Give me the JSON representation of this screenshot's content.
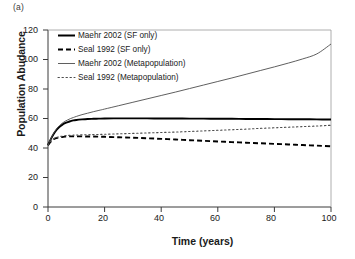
{
  "panel": {
    "label": "(a)"
  },
  "chart_data": {
    "type": "line",
    "title": "",
    "subtitle": "",
    "panel_label": "(a)",
    "xlabel": "Time (years)",
    "ylabel": "Population Abudance",
    "xlim": [
      0,
      100
    ],
    "ylim": [
      0,
      120
    ],
    "xticks": [
      0,
      20,
      40,
      60,
      80,
      100
    ],
    "yticks": [
      0,
      20,
      40,
      60,
      80,
      100,
      120
    ],
    "grid": false,
    "legend_position": "top-left-inside",
    "x": [
      0,
      1,
      2,
      3,
      4,
      5,
      6,
      7,
      8,
      9,
      10,
      12,
      14,
      16,
      18,
      20,
      25,
      30,
      35,
      40,
      45,
      50,
      55,
      60,
      65,
      70,
      75,
      80,
      85,
      90,
      95,
      100
    ],
    "series": [
      {
        "name": "Maehr 2002 (SF only)",
        "style": "solid-thick",
        "color": "#000000",
        "values": [
          42.0,
          46.0,
          49.5,
          52.2,
          54.2,
          55.7,
          56.8,
          57.6,
          58.2,
          58.7,
          59.0,
          59.4,
          59.7,
          59.8,
          59.9,
          60.0,
          60.1,
          60.1,
          60.1,
          60.0,
          60.0,
          59.9,
          59.9,
          59.8,
          59.8,
          59.7,
          59.7,
          59.6,
          59.5,
          59.5,
          59.4,
          59.3
        ]
      },
      {
        "name": "Seal 1992 (SF only)",
        "style": "dashed-thick",
        "color": "#000000",
        "values": [
          42.0,
          44.4,
          45.9,
          46.7,
          47.2,
          47.5,
          47.7,
          47.8,
          47.9,
          47.9,
          47.9,
          47.9,
          47.8,
          47.8,
          47.7,
          47.6,
          47.3,
          47.0,
          46.6,
          46.2,
          45.8,
          45.3,
          44.9,
          44.4,
          44.0,
          43.6,
          43.2,
          42.8,
          42.4,
          42.0,
          41.6,
          41.2
        ]
      },
      {
        "name": "Maehr 2002 (Metapopulation)",
        "style": "solid-thin",
        "color": "#4d4d4d",
        "values": [
          42.0,
          46.3,
          50.0,
          52.9,
          55.1,
          56.8,
          58.1,
          59.1,
          60.0,
          60.7,
          61.4,
          62.6,
          63.6,
          64.6,
          65.5,
          66.4,
          68.7,
          71.0,
          73.3,
          75.6,
          77.9,
          80.3,
          82.7,
          85.1,
          87.5,
          90.0,
          92.5,
          95.0,
          97.6,
          100.4,
          103.8,
          110.5
        ]
      },
      {
        "name": "Seal 1992 (Metapopulation)",
        "style": "dotted-thin",
        "color": "#4d4d4d",
        "values": [
          42.0,
          44.6,
          46.2,
          47.1,
          47.7,
          48.0,
          48.3,
          48.5,
          48.6,
          48.7,
          48.8,
          48.9,
          49.0,
          49.1,
          49.2,
          49.3,
          49.6,
          49.9,
          50.2,
          50.5,
          50.8,
          51.2,
          51.6,
          52.0,
          52.4,
          52.8,
          53.3,
          53.7,
          54.1,
          54.5,
          54.9,
          55.4
        ]
      }
    ]
  },
  "legend": {
    "items": [
      {
        "label": "Maehr 2002 (SF only)",
        "style": "solid-thick"
      },
      {
        "label": "Seal 1992 (SF only)",
        "style": "dashed-thick"
      },
      {
        "label": "Maehr 2002 (Metapopulation)",
        "style": "solid-thin"
      },
      {
        "label": "Seal 1992 (Metapopulation)",
        "style": "dotted-thin"
      }
    ]
  },
  "axes": {
    "y_tick_labels": [
      "120",
      "100",
      "80",
      "60",
      "40",
      "20",
      "0"
    ],
    "x_tick_labels": [
      "0",
      "20",
      "40",
      "60",
      "80",
      "100"
    ]
  }
}
